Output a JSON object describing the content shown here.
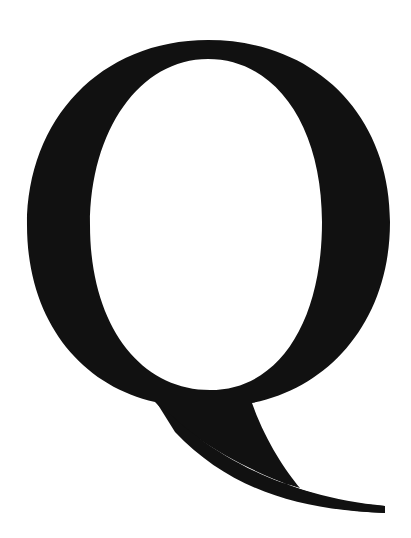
{
  "glyph": {
    "letter": "Q",
    "style": "serif",
    "color": "#111111",
    "background": "#ffffff"
  }
}
